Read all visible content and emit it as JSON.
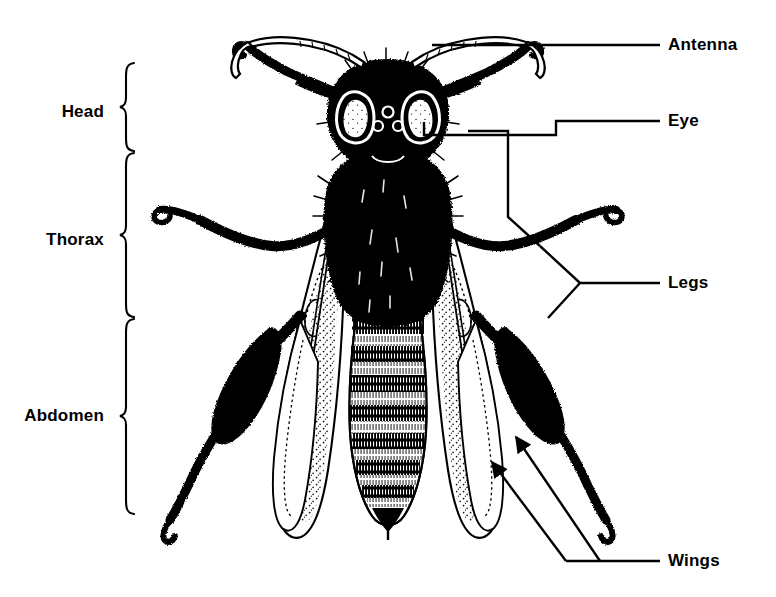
{
  "figure": {
    "background_color": "#FFFFFF",
    "ink_color": "#000000",
    "width": 776,
    "height": 597
  },
  "bracket_labels": [
    {
      "id": "head",
      "label": "Head",
      "text_x": 104,
      "text_y": 112,
      "brace_x": 128,
      "brace_top": 62,
      "brace_bottom": 152
    },
    {
      "id": "thorax",
      "label": "Thorax",
      "text_x": 104,
      "text_y": 240,
      "brace_x": 128,
      "brace_top": 152,
      "brace_bottom": 318
    },
    {
      "id": "abdomen",
      "label": "Abdomen",
      "text_x": 104,
      "text_y": 416,
      "brace_x": 128,
      "brace_top": 318,
      "brace_bottom": 515
    }
  ],
  "callout_labels": [
    {
      "id": "antenna",
      "label": "Antenna",
      "text_x": 668,
      "text_y": 45,
      "line_start_x": 660,
      "line_end_x": 432
    },
    {
      "id": "eye",
      "label": "Eye",
      "text_x": 668,
      "text_y": 121,
      "line_start_x": 660,
      "line_end_x": 424
    },
    {
      "id": "legs",
      "label": "Legs",
      "text_x": 668,
      "text_y": 283,
      "line_start_x": 660,
      "line_end_x": 580
    },
    {
      "id": "wings",
      "label": "Wings",
      "text_x": 668,
      "text_y": 561,
      "line_start_x": 660,
      "line_end_x": 600
    }
  ],
  "anatomy_parts": [
    "antenna-left",
    "antenna-right",
    "compound-eye-left",
    "compound-eye-right",
    "ocelli",
    "head-capsule",
    "thorax",
    "forewing-left",
    "forewing-right",
    "hindwing-left",
    "hindwing-right",
    "abdomen-stripes",
    "stinger",
    "foreleg-left",
    "foreleg-right",
    "midleg-left",
    "midleg-right",
    "hindleg-left",
    "hindleg-right"
  ],
  "abdomen_bands": {
    "count": 7,
    "description": "alternating dark and pale tergite bands"
  }
}
